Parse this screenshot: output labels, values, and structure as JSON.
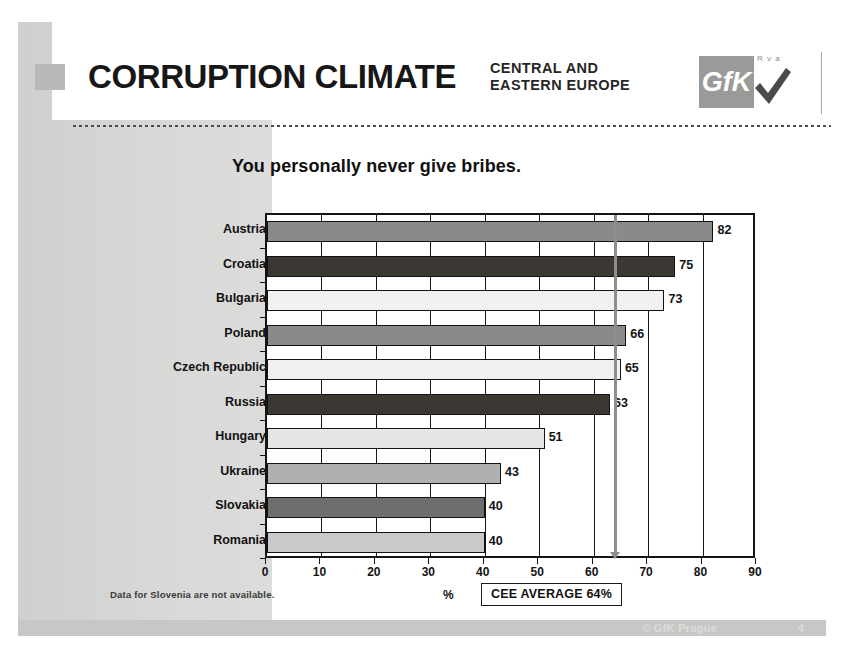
{
  "header": {
    "title": "CORRUPTION CLIMATE",
    "subtitle": "CENTRAL AND\nEASTERN EUROPE",
    "logo_text": "GfK",
    "logo_mini": "R v a",
    "accent_gray": "#9a9a98"
  },
  "footer": {
    "copyright": "© GfK Prague",
    "page_number": "4"
  },
  "notes": {
    "footnote": "Data for Slovenia are not available.",
    "unit_label": "%",
    "average_box": "CEE AVERAGE 64%"
  },
  "chart_data": {
    "type": "bar",
    "orientation": "horizontal",
    "title": "You personally never give bribes.",
    "xlabel": "%",
    "ylabel": "",
    "xlim": [
      0,
      90
    ],
    "xticks": [
      0,
      10,
      20,
      30,
      40,
      50,
      60,
      70,
      80,
      90
    ],
    "grid": true,
    "legend": "none",
    "categories": [
      "Austria",
      "Croatia",
      "Bulgaria",
      "Poland",
      "Czech Republic",
      "Russia",
      "Hungary",
      "Ukraine",
      "Slovakia",
      "Romania"
    ],
    "values": [
      82,
      75,
      73,
      66,
      65,
      63,
      51,
      43,
      40,
      40
    ],
    "bar_colors": [
      "#8a8a88",
      "#3b3733",
      "#f1f1ef",
      "#8a8a88",
      "#f1f1ef",
      "#3b3733",
      "#e6e6e4",
      "#b0b0ae",
      "#6e6e6c",
      "#c9c9c7"
    ],
    "annotations": [
      {
        "label": "CEE AVERAGE 64%",
        "value": 64,
        "type": "vline",
        "color": "#8e8e8c"
      }
    ]
  }
}
